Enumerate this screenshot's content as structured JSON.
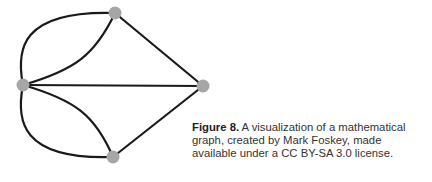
{
  "figure": {
    "label": "Figure 8.",
    "text": " A visualization of a mathematical graph, created by Mark Foskey, made available under a CC BY-SA 3.0 license.",
    "line1_rest": " A visualization of a mathematical",
    "line2": "graph, created by Mark Foskey, made",
    "line3": "available under a CC BY-SA 3.0 license."
  },
  "graph": {
    "node_color": "#a6a6a6",
    "edge_color": "#1a1a1a",
    "nodes": [
      {
        "id": "top",
        "x": 115,
        "y": 13
      },
      {
        "id": "left",
        "x": 23,
        "y": 85
      },
      {
        "id": "right",
        "x": 203,
        "y": 86
      },
      {
        "id": "bottom",
        "x": 113,
        "y": 157
      }
    ],
    "edges": [
      {
        "from": "left",
        "to": "top",
        "count": 2
      },
      {
        "from": "left",
        "to": "bottom",
        "count": 2
      },
      {
        "from": "left",
        "to": "right",
        "count": 1
      },
      {
        "from": "top",
        "to": "right",
        "count": 1
      },
      {
        "from": "bottom",
        "to": "right",
        "count": 1
      }
    ]
  }
}
